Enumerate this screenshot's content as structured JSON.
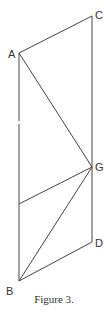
{
  "figure": {
    "caption": "Figure 3.",
    "stroke_color": "#444444",
    "points": {
      "A": {
        "label": "A",
        "x": 19,
        "y": 53
      },
      "C": {
        "label": "C",
        "x": 92,
        "y": 16
      },
      "G": {
        "label": "G",
        "x": 92,
        "y": 167
      },
      "D": {
        "label": "D",
        "x": 92,
        "y": 242
      },
      "B": {
        "label": "B",
        "x": 19,
        "y": 281
      },
      "E": {
        "x": 19,
        "y": 204
      }
    },
    "segments": [
      [
        "A",
        "C"
      ],
      [
        "C",
        "D"
      ],
      [
        "A",
        "B"
      ],
      [
        "A",
        "G"
      ],
      [
        "G",
        "E"
      ],
      [
        "G",
        "B"
      ],
      [
        "B",
        "D"
      ]
    ]
  }
}
